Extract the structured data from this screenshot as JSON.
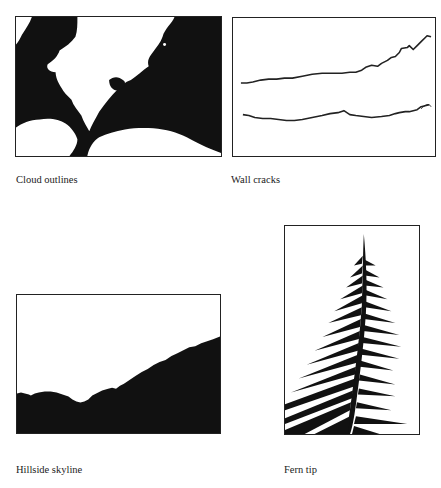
{
  "figures": [
    {
      "id": "cloud",
      "caption": "Cloud outlines",
      "description": "black-and-white silhouette of cloud outlines resembling a coastline"
    },
    {
      "id": "cracks",
      "caption": "Wall cracks",
      "description": "two jagged horizontal crack lines on white background"
    },
    {
      "id": "hill",
      "caption": "Hillside skyline",
      "description": "black hillside silhouette rising from left to right"
    },
    {
      "id": "fern",
      "caption": "Fern tip",
      "description": "black silhouette of a fern frond tip"
    }
  ],
  "colors": {
    "ink": "#111111",
    "paper": "#ffffff",
    "frame": "#222222"
  }
}
